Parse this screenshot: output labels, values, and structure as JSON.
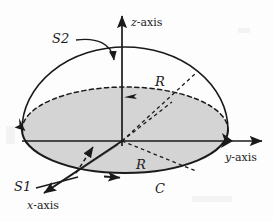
{
  "figure": {
    "background_color": "#fdfdfd",
    "stroke_color": "#1a1a1a",
    "disk_fill_color": "#d4d4d4"
  },
  "axes": [
    {
      "name": "z-axis",
      "label": "z-axis",
      "italic_part": "z",
      "rest": "-axis",
      "direction": "up"
    },
    {
      "name": "y-axis",
      "label": "y-axis",
      "italic_part": "y",
      "rest": "-axis",
      "direction": "right"
    },
    {
      "name": "x-axis",
      "label": "x-axis",
      "italic_part": "x",
      "rest": "-axis",
      "direction": "down-left"
    }
  ],
  "labels": {
    "s1": "S1",
    "s2": "S2",
    "curve_c": "C",
    "radius_upper": "R",
    "radius_lower": "R"
  },
  "annotations": {
    "s1_meaning": "flat disk surface",
    "s2_meaning": "hemispherical cap surface",
    "c_meaning": "boundary circle"
  }
}
